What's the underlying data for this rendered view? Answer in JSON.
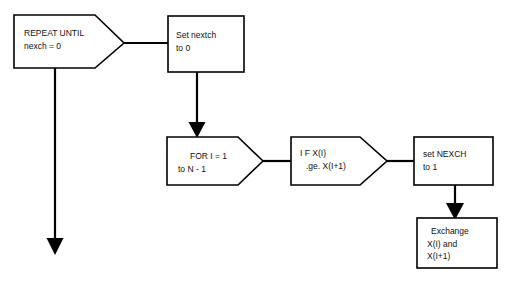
{
  "diagram": {
    "background_color": "#ffffff",
    "line_color": "#000000",
    "text_color": "#111111",
    "nodes": [
      {
        "id": "repeat-until",
        "shape": "pentagon-right",
        "lines": [
          "REPEAT UNTIL",
          "nexch = 0"
        ],
        "x": 14,
        "y": 15,
        "w": 110,
        "h": 54
      },
      {
        "id": "set-nextch",
        "shape": "rectangle",
        "lines": [
          "Set nextch",
          "to 0"
        ],
        "x": 168,
        "y": 16,
        "w": 76,
        "h": 56
      },
      {
        "id": "for-loop",
        "shape": "pentagon-right",
        "lines": [
          "FOR I = 1",
          "to N - 1"
        ],
        "x": 167,
        "y": 137,
        "w": 96,
        "h": 48
      },
      {
        "id": "if-condition",
        "shape": "pentagon-right",
        "lines": [
          "I F X(I)",
          ".ge. X(I+1)"
        ],
        "x": 291,
        "y": 137,
        "w": 96,
        "h": 48
      },
      {
        "id": "set-nexch-1",
        "shape": "rectangle",
        "lines": [
          "set NEXCH",
          "to 1"
        ],
        "x": 414,
        "y": 137,
        "w": 79,
        "h": 48
      },
      {
        "id": "exchange",
        "shape": "rectangle",
        "lines": [
          "Exchange",
          "X(I) and",
          "X(I+1)"
        ],
        "x": 417,
        "y": 218,
        "w": 80,
        "h": 50
      }
    ],
    "connectors": [
      {
        "id": "repeat-to-set-nextch",
        "from": "repeat-until",
        "to": "set-nextch",
        "arrow": false
      },
      {
        "id": "set-nextch-to-for",
        "from": "set-nextch",
        "to": "for-loop",
        "arrow": true
      },
      {
        "id": "for-to-if",
        "from": "for-loop",
        "to": "if-condition",
        "arrow": false
      },
      {
        "id": "if-to-set-nexch",
        "from": "if-condition",
        "to": "set-nexch-1",
        "arrow": false
      },
      {
        "id": "set-nexch-to-exchange",
        "from": "set-nexch-1",
        "to": "exchange",
        "arrow": true
      },
      {
        "id": "repeat-loop-back",
        "from": "repeat-until",
        "to": null,
        "arrow": true
      }
    ]
  }
}
